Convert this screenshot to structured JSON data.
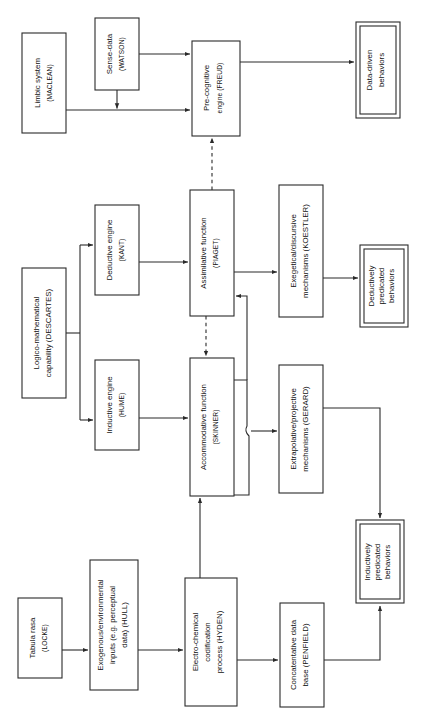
{
  "diagram": {
    "orientation": "rotated-90-ccw",
    "stroke_color": "#2a2a2a",
    "background_color": "#ffffff",
    "nodes": [
      {
        "id": "limbic",
        "line1": "Limbic system",
        "line2": "(MACLEAN)",
        "line3": "",
        "double": false,
        "x": 22,
        "y": 33,
        "w": 44,
        "h": 100
      },
      {
        "id": "sense",
        "line1": "Sense-data",
        "line2": "(WATSON)",
        "line3": "",
        "double": false,
        "x": 95,
        "y": 18,
        "w": 44,
        "h": 72
      },
      {
        "id": "precog",
        "line1": "Pre-cognitive",
        "line2": "engine (FREUD)",
        "line3": "",
        "double": false,
        "x": 192,
        "y": 41,
        "w": 48,
        "h": 95
      },
      {
        "id": "datadriven",
        "line1": "Data-driven",
        "line2": "behaviors",
        "line3": "",
        "double": true,
        "x": 356,
        "y": 22,
        "w": 44,
        "h": 96
      },
      {
        "id": "logico",
        "line1": "Logico-mathematical",
        "line2": "capability (DESCARTES)",
        "line3": "",
        "double": false,
        "x": 22,
        "y": 268,
        "w": 44,
        "h": 130
      },
      {
        "id": "deductive",
        "line1": "Deductive engine",
        "line2": "(KANT)",
        "line3": "",
        "double": false,
        "x": 95,
        "y": 205,
        "w": 44,
        "h": 90
      },
      {
        "id": "inductive",
        "line1": "Inductive engine",
        "line2": "(HUME)",
        "line3": "",
        "double": false,
        "x": 95,
        "y": 360,
        "w": 44,
        "h": 90
      },
      {
        "id": "assimilative",
        "line1": "Assimilative function",
        "line2": "(PIAGET)",
        "line3": "",
        "double": false,
        "x": 190,
        "y": 190,
        "w": 44,
        "h": 126
      },
      {
        "id": "accommodative",
        "line1": "Accommodative function",
        "line2": "(SKINNER)",
        "line3": "",
        "double": false,
        "x": 190,
        "y": 358,
        "w": 44,
        "h": 138
      },
      {
        "id": "exegetical",
        "line1": "Exegetical/discursive",
        "line2": "mechanisms (KOESTLER)",
        "line3": "",
        "double": false,
        "x": 279,
        "y": 185,
        "w": 44,
        "h": 132
      },
      {
        "id": "deductively",
        "line1": "Deductively",
        "line2": "predicated",
        "line3": "behaviors",
        "double": true,
        "x": 360,
        "y": 245,
        "w": 48,
        "h": 82
      },
      {
        "id": "extrapolative",
        "line1": "Extrapolative/projective",
        "line2": "mechanisms (GERARD)",
        "line3": "",
        "double": false,
        "x": 279,
        "y": 365,
        "w": 44,
        "h": 128
      },
      {
        "id": "inductively",
        "line1": "Inductively",
        "line2": "predicated",
        "line3": "behaviors",
        "double": true,
        "x": 356,
        "y": 520,
        "w": 48,
        "h": 83
      },
      {
        "id": "tabula",
        "line1": "Tabula rasa",
        "line2": "(LOCKE)",
        "line3": "",
        "double": false,
        "x": 18,
        "y": 598,
        "w": 44,
        "h": 80
      },
      {
        "id": "exogenous",
        "line1": "Exogenous/environmental",
        "line2": "inputs (e.g. perceptual",
        "line3": "data) (HULL)",
        "double": false,
        "x": 90,
        "y": 560,
        "w": 48,
        "h": 130
      },
      {
        "id": "electro",
        "line1": "Electro-chemical",
        "line2": "codification",
        "line3": "process (HYDEN)",
        "double": false,
        "x": 185,
        "y": 578,
        "w": 52,
        "h": 128
      },
      {
        "id": "concatentative",
        "line1": "Concatentative data",
        "line2": "base (PENFIELD)",
        "line3": "",
        "double": false,
        "x": 280,
        "y": 603,
        "w": 44,
        "h": 104
      }
    ],
    "edges": [
      {
        "id": "limbic-to-precog",
        "from": "limbic",
        "to": "precog",
        "style": "solid"
      },
      {
        "id": "sense-to-precog",
        "from": "sense",
        "to": "precog",
        "style": "solid"
      },
      {
        "id": "sense-down-join",
        "from": "sense",
        "to": "limbic-line",
        "style": "solid"
      },
      {
        "id": "precog-to-datadriven",
        "from": "precog",
        "to": "datadriven",
        "style": "solid"
      },
      {
        "id": "assimilative-to-precog",
        "from": "assimilative",
        "to": "precog",
        "style": "dashed"
      },
      {
        "id": "logico-to-deductive",
        "from": "logico",
        "to": "deductive",
        "style": "solid"
      },
      {
        "id": "logico-to-inductive",
        "from": "logico",
        "to": "inductive",
        "style": "solid"
      },
      {
        "id": "deductive-to-assimilative",
        "from": "deductive",
        "to": "assimilative",
        "style": "solid"
      },
      {
        "id": "inductive-to-accommodative",
        "from": "inductive",
        "to": "accommodative",
        "style": "solid"
      },
      {
        "id": "assimilative-to-accommodative",
        "from": "assimilative",
        "to": "accommodative",
        "style": "dashed"
      },
      {
        "id": "accommodative-to-assimilative",
        "from": "accommodative",
        "to": "assimilative",
        "style": "solid"
      },
      {
        "id": "assimilative-to-exegetical",
        "from": "assimilative",
        "to": "exegetical",
        "style": "solid"
      },
      {
        "id": "exegetical-to-deductively",
        "from": "exegetical",
        "to": "deductively",
        "style": "solid"
      },
      {
        "id": "accommodative-to-extrapolative",
        "from": "accommodative",
        "to": "extrapolative",
        "style": "solid"
      },
      {
        "id": "extrapolative-to-inductively",
        "from": "extrapolative",
        "to": "inductively",
        "style": "solid"
      },
      {
        "id": "tabula-to-exogenous",
        "from": "tabula",
        "to": "exogenous",
        "style": "solid"
      },
      {
        "id": "exogenous-to-electro",
        "from": "exogenous",
        "to": "electro",
        "style": "solid"
      },
      {
        "id": "electro-to-accommodative",
        "from": "electro",
        "to": "accommodative",
        "style": "solid"
      },
      {
        "id": "electro-to-concatentative",
        "from": "electro",
        "to": "concatentative",
        "style": "solid"
      },
      {
        "id": "concatentative-to-inductively",
        "from": "concatentative",
        "to": "inductively",
        "style": "solid"
      }
    ]
  }
}
